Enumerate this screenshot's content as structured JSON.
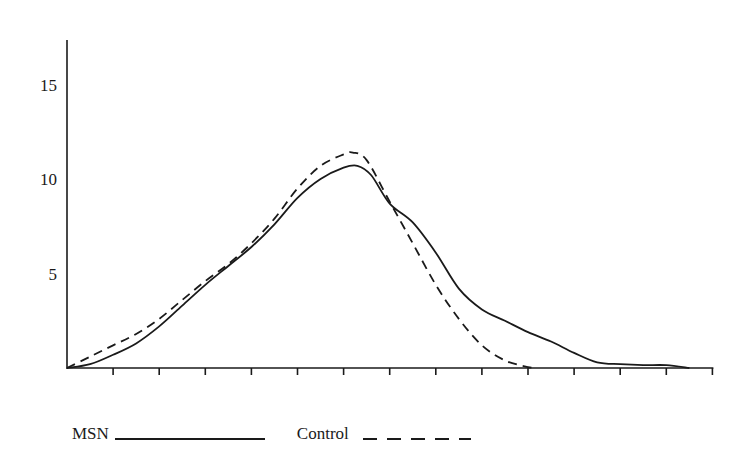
{
  "chart_data": {
    "type": "line",
    "title": "",
    "xlabel": "",
    "ylabel": "",
    "ylim": [
      0,
      17.3
    ],
    "xlim": [
      0,
      14
    ],
    "y_ticks": [
      5,
      10,
      15
    ],
    "x_tick_count": 14,
    "x_tick_labels": [],
    "grid": false,
    "legend_position": "bottom-left",
    "series": [
      {
        "name": "MSN",
        "style": "solid",
        "x": [
          0,
          0.5,
          1,
          1.5,
          2,
          2.5,
          3,
          3.5,
          4,
          4.5,
          5,
          5.5,
          6,
          6.3,
          6.6,
          7,
          7.5,
          8,
          8.5,
          9,
          9.5,
          10,
          10.5,
          11,
          11.5,
          12,
          12.5,
          13,
          13.5
        ],
        "values": [
          0,
          0.2,
          0.7,
          1.3,
          2.2,
          3.3,
          4.4,
          5.4,
          6.4,
          7.6,
          9.0,
          10.0,
          10.6,
          10.7,
          10.2,
          8.7,
          7.7,
          6.1,
          4.2,
          3.1,
          2.5,
          1.9,
          1.4,
          0.8,
          0.3,
          0.2,
          0.15,
          0.15,
          0
        ]
      },
      {
        "name": "Control",
        "style": "dashed",
        "x": [
          0,
          0.5,
          1,
          1.5,
          2,
          2.5,
          3,
          3.5,
          4,
          4.5,
          5,
          5.5,
          6,
          6.2,
          6.5,
          7,
          7.5,
          8,
          8.5,
          9,
          9.5,
          10,
          10.2
        ],
        "values": [
          0,
          0.6,
          1.2,
          1.8,
          2.6,
          3.6,
          4.6,
          5.5,
          6.6,
          7.9,
          9.5,
          10.7,
          11.3,
          11.4,
          11.0,
          8.8,
          6.6,
          4.4,
          2.6,
          1.2,
          0.4,
          0.05,
          0
        ]
      }
    ]
  },
  "legend": {
    "items": [
      {
        "label": "MSN",
        "style": "solid"
      },
      {
        "label": "Control",
        "style": "dashed"
      }
    ]
  },
  "axis": {
    "y_labels": [
      "15",
      "10",
      "5"
    ]
  }
}
